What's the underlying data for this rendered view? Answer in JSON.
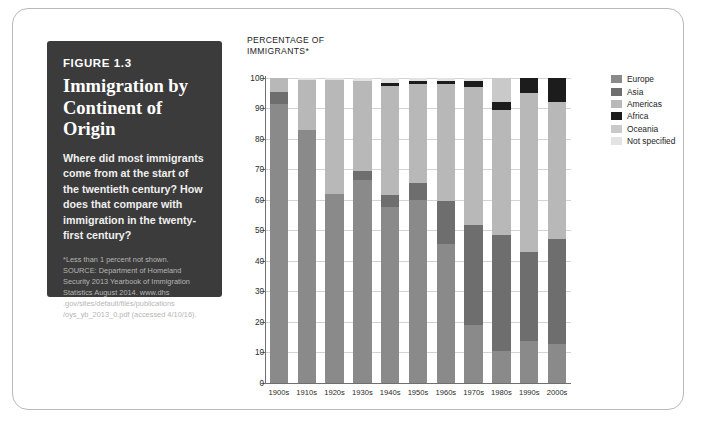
{
  "figure": {
    "number": "FIGURE 1.3",
    "title": "Immigration by Continent of Origin",
    "description": "Where did most immigrants come from at the start of the twentieth century? How does that compare with immigration in the twenty-first century?",
    "source_lines": [
      "*Less than 1 percent not shown.",
      "SOURCE: Department of Homeland",
      "Security 2013 Yearbook of Immigration",
      "Statistics August 2014. www.dhs",
      ".gov/sites/default/files/publications",
      "/oys_yb_2013_0.pdf (accessed 4/10/16)."
    ]
  },
  "chart_data": {
    "type": "bar",
    "subtype": "stacked-vertical-100",
    "xlabel": "",
    "ylabel": "PERCENTAGE OF IMMIGRANTS*",
    "ylim": [
      0,
      100
    ],
    "ytick_labels": [
      "0",
      "10",
      "20",
      "30",
      "40",
      "50",
      "60",
      "70",
      "80",
      "90",
      "100"
    ],
    "ytick_values": [
      0,
      10,
      20,
      30,
      40,
      50,
      60,
      70,
      80,
      90,
      100
    ],
    "grid": true,
    "legend_position": "right",
    "categories": [
      "1900s",
      "1910s",
      "1920s",
      "1930s",
      "1940s",
      "1950s",
      "1960s",
      "1970s",
      "1980s",
      "1990s",
      "2000s"
    ],
    "series": [
      {
        "name": "Europe",
        "color": "#8a8a8a",
        "values": [
          91.6,
          83.0,
          62.0,
          66.5,
          57.5,
          60.0,
          45.5,
          18.8,
          10.5,
          13.5,
          12.5
        ]
      },
      {
        "name": "Asia",
        "color": "#6e6e6e",
        "values": [
          3.9,
          0.0,
          0.0,
          3.0,
          4.0,
          5.5,
          14.0,
          33.0,
          38.0,
          29.5,
          34.5
        ]
      },
      {
        "name": "Americas",
        "color": "#b8b8b8",
        "values": [
          4.5,
          16.5,
          37.5,
          29.5,
          36.0,
          32.5,
          38.5,
          45.2,
          41.0,
          52.0,
          45.0
        ]
      },
      {
        "name": "Africa",
        "color": "#1c1c1c",
        "values": [
          0.0,
          0.0,
          0.0,
          0.0,
          1.0,
          1.0,
          1.0,
          2.0,
          2.5,
          5.0,
          8.0
        ]
      },
      {
        "name": "Oceania",
        "color": "#c9c9c9",
        "values": [
          0.0,
          0.0,
          0.0,
          0.0,
          0.0,
          0.0,
          0.0,
          0.0,
          8.0,
          0.0,
          0.0
        ]
      },
      {
        "name": "Not specified",
        "color": "#e3e3e3",
        "values": [
          0.0,
          0.5,
          0.5,
          1.0,
          1.5,
          1.0,
          1.0,
          1.0,
          0.0,
          0.0,
          0.0
        ]
      }
    ]
  },
  "legend": {
    "items": [
      {
        "label": "Europe",
        "color": "#8a8a8a"
      },
      {
        "label": "Asia",
        "color": "#6e6e6e"
      },
      {
        "label": "Americas",
        "color": "#b8b8b8"
      },
      {
        "label": "Africa",
        "color": "#1c1c1c"
      },
      {
        "label": "Oceania",
        "color": "#c9c9c9"
      },
      {
        "label": "Not specified",
        "color": "#e3e3e3"
      }
    ]
  }
}
